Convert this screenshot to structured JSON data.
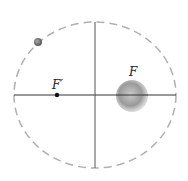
{
  "diagram": {
    "type": "ellipse-orbit",
    "labels": {
      "focus_empty": "F′",
      "focus_planet": "F"
    },
    "colors": {
      "ellipse": "#b0b0b0",
      "axes": "#333333",
      "planet": "#9a9a9a",
      "moon": "#777777"
    }
  }
}
